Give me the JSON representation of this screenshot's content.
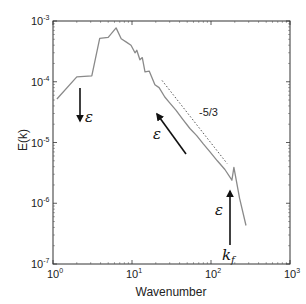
{
  "chart_data": {
    "type": "line",
    "title": "",
    "xlabel": "Wavenumber",
    "ylabel": "E(k)",
    "xscale": "log",
    "yscale": "log",
    "xlim": [
      1,
      1000
    ],
    "ylim": [
      1e-07,
      0.001
    ],
    "grid": false,
    "legend": null,
    "x_ticks": [
      {
        "base": "10",
        "exp": "0",
        "value": 1
      },
      {
        "base": "10",
        "exp": "1",
        "value": 10
      },
      {
        "base": "10",
        "exp": "2",
        "value": 100
      },
      {
        "base": "10",
        "exp": "3",
        "value": 1000
      }
    ],
    "y_ticks": [
      {
        "base": "10",
        "exp": "-3",
        "value": 0.001
      },
      {
        "base": "10",
        "exp": "-4",
        "value": 0.0001
      },
      {
        "base": "10",
        "exp": "-5",
        "value": 1e-05
      },
      {
        "base": "10",
        "exp": "-6",
        "value": 1e-06
      },
      {
        "base": "10",
        "exp": "-7",
        "value": 1e-07
      }
    ],
    "series": [
      {
        "name": "E(k)",
        "color": "#8a8a8a",
        "x": [
          1.12,
          2.0,
          3.1,
          3.9,
          5.0,
          6.3,
          7.3,
          8.5,
          9.7,
          10.9,
          11.5,
          12.6,
          13.5,
          14.6,
          16.5,
          19.5,
          22,
          26,
          30,
          36,
          44,
          54,
          66,
          80,
          97,
          120,
          150,
          184,
          195,
          230,
          277
        ],
        "y": [
          5.2e-05,
          0.00012,
          0.000125,
          0.00052,
          0.00054,
          0.00077,
          0.00051,
          0.00045,
          0.0004,
          0.0003,
          0.00033,
          0.00023,
          0.00025,
          0.000145,
          0.00015,
          8.9e-05,
          8e-05,
          5.6e-05,
          4.5e-05,
          3.4e-05,
          2.4e-05,
          1.7e-05,
          1.3e-05,
          9.5e-06,
          7e-06,
          5e-06,
          3.6e-06,
          2.4e-06,
          3.9e-06,
          1.2e-06,
          4.3e-07
        ]
      }
    ],
    "reference_line": {
      "label": "-5/3",
      "style": "dotted",
      "slope": -1.6667,
      "x": [
        24,
        160
      ],
      "y": [
        0.000105,
        4.5e-06
      ]
    },
    "annotations": [
      {
        "text": "ε",
        "arrow": "down",
        "at_x": 2.0,
        "from_y": 9e-05,
        "to_y": 2.5e-05
      },
      {
        "text": "ε",
        "arrow": "up-left",
        "from": [
          34,
          1.2e-05
        ],
        "to": [
          14.7,
          2.6e-05
        ]
      },
      {
        "text": "ε",
        "arrow": "up",
        "at_x": 180,
        "from_y": 3e-07,
        "to_y": 3.5e-06
      },
      {
        "text": "k_f",
        "label": "forcing wavenumber",
        "at_x": 180,
        "y": 1.5e-07
      }
    ]
  },
  "labels": {
    "xlabel": "Wavenumber",
    "ylabel": "E(k)",
    "slope": "-5/3",
    "epsilon": "ε",
    "kf_main": "k",
    "kf_sub": "f"
  },
  "colors": {
    "curve": "#8a8a8a",
    "axes": "#333333",
    "arrows": "#111111",
    "text": "#222222"
  }
}
